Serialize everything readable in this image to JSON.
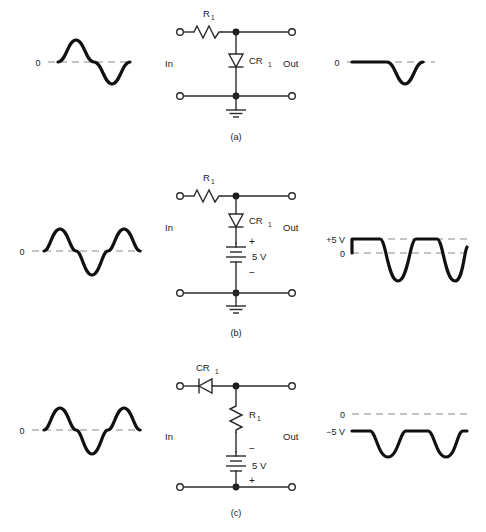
{
  "figure": {
    "background_color": "#ffffff",
    "wire_color": "#2b2b2b",
    "waveform_color": "#111111",
    "dash_color": "#8a8a8a"
  },
  "rows": [
    {
      "id": "a",
      "caption": "(a)",
      "input_label": "In",
      "output_label": "Out",
      "components": [
        {
          "name": "resistor",
          "label": "R",
          "subscript": "1",
          "orientation": "horizontal"
        },
        {
          "name": "diode",
          "label": "CR",
          "subscript": "1",
          "orientation": "vertical",
          "points": "down"
        },
        {
          "name": "ground",
          "label": "",
          "subscript": ""
        }
      ],
      "input_wave": {
        "zero_label": "0",
        "cycles": 1,
        "description": "one sine cycle about zero"
      },
      "output_wave": {
        "labels": [
          "0"
        ],
        "description": "positive half clipped flat at 0, negative half passes"
      }
    },
    {
      "id": "b",
      "caption": "(b)",
      "input_label": "In",
      "output_label": "Out",
      "components": [
        {
          "name": "resistor",
          "label": "R",
          "subscript": "1",
          "orientation": "horizontal"
        },
        {
          "name": "diode",
          "label": "CR",
          "subscript": "1",
          "orientation": "vertical",
          "points": "down"
        },
        {
          "name": "battery",
          "label": "5 V",
          "top_polarity": "+",
          "bottom_polarity": "−"
        },
        {
          "name": "ground",
          "label": "",
          "subscript": ""
        }
      ],
      "input_wave": {
        "zero_label": "0",
        "cycles": 2,
        "description": "two sine cycles about zero"
      },
      "output_wave": {
        "labels": [
          "+5 V",
          "0"
        ],
        "clip_level": "+5 V",
        "description": "positive peaks clipped flat at +5 V, negative halves pass"
      }
    },
    {
      "id": "c",
      "caption": "(c)",
      "input_label": "In",
      "output_label": "Out",
      "components": [
        {
          "name": "diode",
          "label": "CR",
          "subscript": "1",
          "orientation": "horizontal",
          "points": "left"
        },
        {
          "name": "resistor",
          "label": "R",
          "subscript": "1",
          "orientation": "vertical"
        },
        {
          "name": "battery",
          "label": "5 V",
          "top_polarity": "−",
          "bottom_polarity": "+"
        }
      ],
      "input_wave": {
        "zero_label": "0",
        "cycles": 2,
        "description": "two sine cycles about zero"
      },
      "output_wave": {
        "labels": [
          "0",
          "−5 V"
        ],
        "clip_level": "−5 V",
        "description": "waveform sits at -5 V with negative dips below"
      }
    }
  ]
}
